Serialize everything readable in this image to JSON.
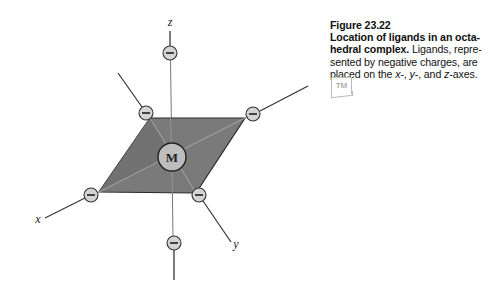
{
  "figure": {
    "number": "Figure 23.22",
    "title_line1": "Location of ligands in an octa-",
    "title_line2_bold": "hedral complex.",
    "body_line2": " Ligands, repre-",
    "body_line3": "sented by negative charges, are",
    "body_line4_pre": "placed on the ",
    "axis_x": "x",
    "axis_y": "y",
    "axis_z": "z",
    "sep1": "-, ",
    "sep2": "-, and ",
    "suffix": "-axes.",
    "tm_badge": "TM"
  },
  "diagram": {
    "metal_label": "M",
    "ligand_symbol": "−",
    "axis_labels": {
      "x": "x",
      "y": "y",
      "z": "z"
    },
    "ligand_count": 6,
    "colors": {
      "plane_fill": "#7a7a7a",
      "plane_edge": "#2a2a2a",
      "ligand_fill": "#d4d4d4",
      "metal_fill": "#bdbdbd",
      "axis_line": "#333333"
    }
  }
}
